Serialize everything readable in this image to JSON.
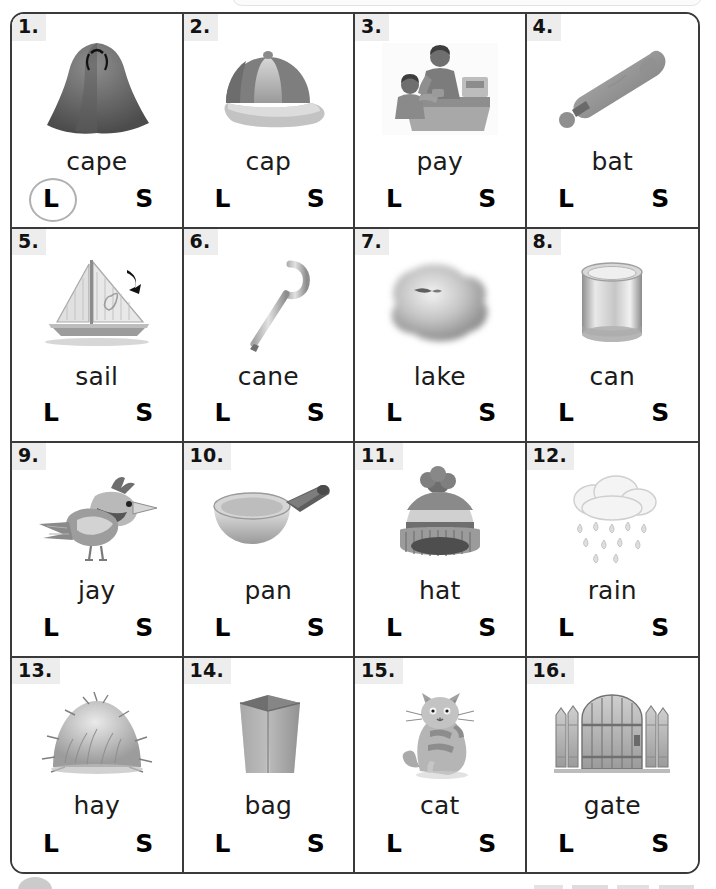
{
  "worksheet": {
    "choice_long_label": "L",
    "choice_short_label": "S",
    "items": [
      {
        "number": "1.",
        "word": "cape",
        "icon": "cape-icon",
        "marked": "L"
      },
      {
        "number": "2.",
        "word": "cap",
        "icon": "cap-icon",
        "marked": ""
      },
      {
        "number": "3.",
        "word": "pay",
        "icon": "pay-icon",
        "marked": ""
      },
      {
        "number": "4.",
        "word": "bat",
        "icon": "bat-icon",
        "marked": ""
      },
      {
        "number": "5.",
        "word": "sail",
        "icon": "sailboat-icon",
        "marked": ""
      },
      {
        "number": "6.",
        "word": "cane",
        "icon": "cane-icon",
        "marked": ""
      },
      {
        "number": "7.",
        "word": "lake",
        "icon": "lake-icon",
        "marked": ""
      },
      {
        "number": "8.",
        "word": "can",
        "icon": "can-icon",
        "marked": ""
      },
      {
        "number": "9.",
        "word": "jay",
        "icon": "jay-bird-icon",
        "marked": ""
      },
      {
        "number": "10.",
        "word": "pan",
        "icon": "pan-icon",
        "marked": ""
      },
      {
        "number": "11.",
        "word": "hat",
        "icon": "winter-hat-icon",
        "marked": ""
      },
      {
        "number": "12.",
        "word": "rain",
        "icon": "rain-cloud-icon",
        "marked": ""
      },
      {
        "number": "13.",
        "word": "hay",
        "icon": "haystack-icon",
        "marked": ""
      },
      {
        "number": "14.",
        "word": "bag",
        "icon": "paper-bag-icon",
        "marked": ""
      },
      {
        "number": "15.",
        "word": "cat",
        "icon": "cat-icon",
        "marked": ""
      },
      {
        "number": "16.",
        "word": "gate",
        "icon": "gate-icon",
        "marked": ""
      }
    ]
  },
  "colors": {
    "border": "#3a3a3a",
    "badge_bg": "#ededed",
    "text": "#1b1b1b",
    "circle_mark": "#b0b0b0"
  }
}
